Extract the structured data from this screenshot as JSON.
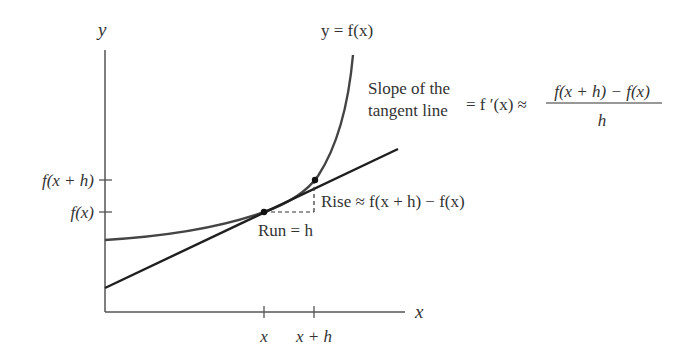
{
  "diagram": {
    "axes": {
      "y_label": "y",
      "x_label": "x",
      "y_ticks": [
        {
          "label": "f(x + h)",
          "y": 180
        },
        {
          "label": "f(x)",
          "y": 212
        }
      ],
      "x_ticks": [
        {
          "label": "x",
          "x": 264
        },
        {
          "label": "x + h",
          "x": 314
        }
      ]
    },
    "curve_label": "y = f(x)",
    "rise_label": "Rise ≈ f(x + h) − f(x)",
    "run_label": "Run = h",
    "slope_text": {
      "line1": "Slope of the",
      "line2": "tangent line",
      "equals": "= f ′(x) ≈",
      "numerator": "f(x + h) − f(x)",
      "denominator": "h"
    },
    "colors": {
      "axis": "#555555",
      "curve": "#444444",
      "tangent": "#1f1f1f",
      "text": "#333333"
    }
  }
}
